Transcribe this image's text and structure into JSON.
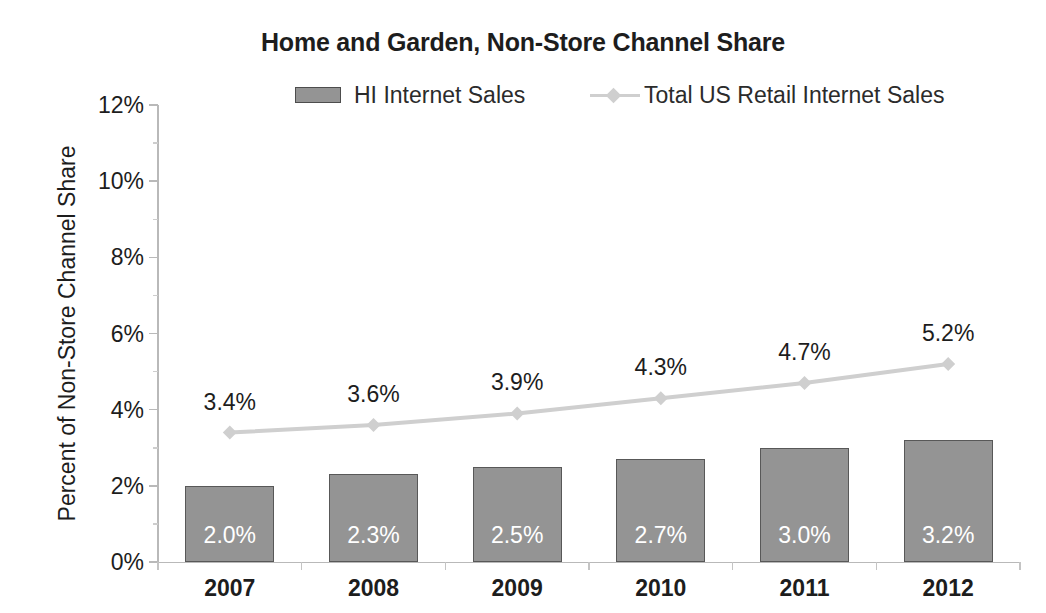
{
  "chart_data": {
    "type": "bar",
    "title": "Home and Garden, Non-Store Channel Share",
    "xlabel": "",
    "ylabel": "Percent of Non-Store Channel Share",
    "categories": [
      "2007",
      "2008",
      "2009",
      "2010",
      "2011",
      "2012"
    ],
    "ylim": [
      0,
      12
    ],
    "y_ticks": [
      0,
      2,
      4,
      6,
      8,
      10,
      12
    ],
    "y_tick_labels": [
      "0%",
      "2%",
      "4%",
      "6%",
      "8%",
      "10%",
      "12%"
    ],
    "y_minor_step": 1,
    "grid": false,
    "legend_position": "top",
    "series": [
      {
        "name": "HI Internet Sales",
        "type": "bar",
        "color": "#949494",
        "border_color": "#585858",
        "label_color": "#ffffff",
        "values": [
          2.0,
          2.3,
          2.5,
          2.7,
          3.0,
          3.2
        ],
        "data_labels": [
          "2.0%",
          "2.3%",
          "2.5%",
          "2.7%",
          "3.0%",
          "3.2%"
        ]
      },
      {
        "name": "Total US Retail Internet Sales",
        "type": "line",
        "color": "#cfcfcf",
        "marker": "diamond",
        "label_color": "#1d1d1d",
        "values": [
          3.4,
          3.6,
          3.9,
          4.3,
          4.7,
          5.2
        ],
        "data_labels": [
          "3.4%",
          "3.6%",
          "3.9%",
          "4.3%",
          "4.7%",
          "5.2%"
        ]
      }
    ]
  },
  "legend": {
    "bar_label": "HI Internet Sales",
    "line_label": "Total US Retail Internet Sales"
  }
}
